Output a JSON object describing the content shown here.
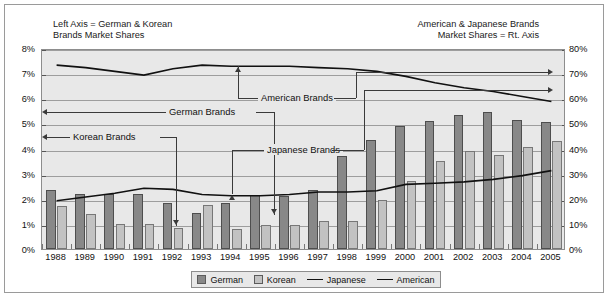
{
  "captions": {
    "left_line1": "Left Axis = German & Korean",
    "left_line2": "Brands Market Shares",
    "right_line1": "American & Japanese Brands",
    "right_line2": "Market Shares = Rt. Axis"
  },
  "annotations": {
    "german": "German Brands",
    "korean": "Korean Brands",
    "japanese": "Japanese Brands",
    "american": "American Brands"
  },
  "legend": [
    {
      "label": "German",
      "marker": "bar-dark-swatch",
      "color": "#888888"
    },
    {
      "label": "Korean",
      "marker": "bar-light-swatch",
      "color": "#c2c2c2"
    },
    {
      "label": "Japanese",
      "marker": "line-swatch",
      "color": "#111111"
    },
    {
      "label": "American",
      "marker": "line-swatch",
      "color": "#111111"
    }
  ],
  "axis_left": {
    "labels": [
      "8%",
      "7%",
      "6%",
      "5%",
      "4%",
      "3%",
      "2%",
      "1%",
      "0%"
    ],
    "min": 0,
    "max": 8,
    "step": 1,
    "unit": "%"
  },
  "axis_right": {
    "labels": [
      "80%",
      "70%",
      "60%",
      "50%",
      "40%",
      "30%",
      "20%",
      "10%",
      "0%"
    ],
    "min": 0,
    "max": 80,
    "step": 10,
    "unit": "%"
  },
  "chart_data": {
    "type": "bar",
    "title": "",
    "subtitle": "",
    "xlabel": "",
    "ylabel": "German & Korean Brands Market Shares",
    "y2label": "American & Japanese Brands Market Shares",
    "ylim": [
      0,
      8
    ],
    "y2lim": [
      0,
      80
    ],
    "grid": true,
    "legend_position": "bottom",
    "categories": [
      "1988",
      "1989",
      "1990",
      "1991",
      "1992",
      "1993",
      "1994",
      "1995",
      "1996",
      "1997",
      "1998",
      "1999",
      "2000",
      "2001",
      "2002",
      "2003",
      "2004",
      "2005"
    ],
    "series": [
      {
        "name": "German",
        "kind": "bar",
        "axis": "left",
        "color": "#888888",
        "values": [
          2.35,
          2.2,
          2.2,
          2.2,
          1.85,
          1.45,
          1.85,
          2.15,
          2.1,
          2.35,
          3.7,
          4.35,
          4.9,
          5.1,
          5.35,
          5.45,
          5.15,
          5.05
        ]
      },
      {
        "name": "Korean",
        "kind": "bar",
        "axis": "left",
        "color": "#c2c2c2",
        "values": [
          1.7,
          1.4,
          1.0,
          1.0,
          0.85,
          1.75,
          0.8,
          0.95,
          0.95,
          1.1,
          1.1,
          1.95,
          2.7,
          3.5,
          3.9,
          3.75,
          4.05,
          4.3
        ]
      },
      {
        "name": "Japanese",
        "kind": "line",
        "axis": "right",
        "color": "#111111",
        "values": [
          20.0,
          21.5,
          23.0,
          25.0,
          24.5,
          22.5,
          22.0,
          22.0,
          22.5,
          23.5,
          23.5,
          24.0,
          26.5,
          27.0,
          27.5,
          28.5,
          30.0,
          32.0
        ]
      },
      {
        "name": "American",
        "kind": "line",
        "axis": "right",
        "color": "#111111",
        "values": [
          74.0,
          73.0,
          71.5,
          70.0,
          72.5,
          74.0,
          73.5,
          73.5,
          73.5,
          73.0,
          72.5,
          71.5,
          69.5,
          67.0,
          65.0,
          63.5,
          61.5,
          59.5
        ]
      }
    ]
  },
  "years": [
    "1988",
    "1989",
    "1990",
    "1991",
    "1992",
    "1993",
    "1994",
    "1995",
    "1996",
    "1997",
    "1998",
    "1999",
    "2000",
    "2001",
    "2002",
    "2003",
    "2004",
    "2005"
  ]
}
